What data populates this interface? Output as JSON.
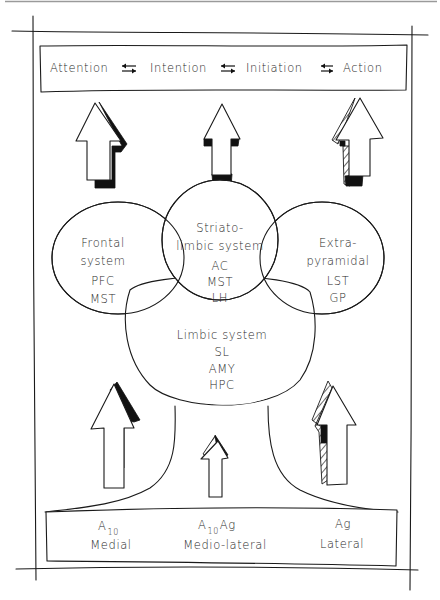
{
  "process_chain": {
    "steps": [
      "Attention",
      "Intention",
      "Initiation",
      "Action"
    ],
    "connector_icon": "bidirectional-arrows-icon"
  },
  "systems": {
    "frontal": {
      "title_lines": [
        "Frontal",
        "system"
      ],
      "structures": [
        "PFC",
        "MST"
      ]
    },
    "striatolimbic": {
      "title_lines": [
        "Striato-",
        "limbic system"
      ],
      "structures": [
        "AC",
        "MST",
        "LH"
      ]
    },
    "extrapyramidal": {
      "title_lines": [
        "Extra-",
        "pyramidal"
      ],
      "structures": [
        "LST",
        "GP"
      ]
    },
    "limbic": {
      "title_lines": [
        "Limbic system"
      ],
      "structures": [
        "SL",
        "AMY",
        "HPC"
      ]
    }
  },
  "dopamine_sources": [
    {
      "label": "A",
      "subscript": "10",
      "suffix": "",
      "pathway": "Medial"
    },
    {
      "label": "A",
      "subscript": "10",
      "suffix": "Ag",
      "pathway": "Medio-lateral"
    },
    {
      "label": "Ag",
      "subscript": "",
      "suffix": "",
      "pathway": "Lateral"
    }
  ],
  "arrow_styles": {
    "top": [
      "solid-shadow",
      "solid-base",
      "hatched-shadow"
    ],
    "bottom": [
      "solid-shadow",
      "hatched-tip",
      "hatched-full"
    ]
  },
  "colors": {
    "ink": "#1a1a1a",
    "paper": "#ffffff"
  }
}
